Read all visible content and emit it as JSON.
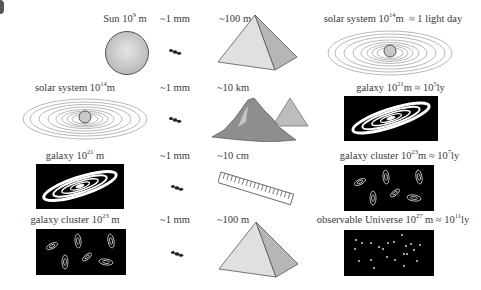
{
  "rows": [
    {
      "left": {
        "name": "Sun",
        "exp": "9",
        "unit": "m",
        "suffix": "",
        "icon": "sun-icon"
      },
      "ant": {
        "label": "~1 mm",
        "icon": "ant-icon"
      },
      "mid": {
        "label": "~100 m",
        "icon": "pyramid-icon"
      },
      "right": {
        "name": "solar system",
        "exp": "14",
        "unit": "m",
        "approx": "≈ 1 light day",
        "icon": "solar-system-icon"
      }
    },
    {
      "left": {
        "name": "solar system",
        "exp": "14",
        "unit": "m",
        "icon": "solar-system-icon"
      },
      "ant": {
        "label": "~1 mm",
        "icon": "ant-icon"
      },
      "mid": {
        "label": "~10 km",
        "icon": "mountain-icon"
      },
      "right": {
        "name": "galaxy",
        "exp": "21",
        "unit": "m",
        "approx_pre": "≈ 10",
        "approx_exp": "5",
        "approx_unit": "ly",
        "icon": "galaxy-icon"
      }
    },
    {
      "left": {
        "name": "galaxy",
        "exp": "21",
        "unit": "m",
        "icon": "galaxy-icon"
      },
      "ant": {
        "label": "~1 mm",
        "icon": "ant-icon"
      },
      "mid": {
        "label": "~10 cm",
        "icon": "ruler-icon"
      },
      "right": {
        "name": "galaxy cluster",
        "exp": "23",
        "unit": "m",
        "approx_pre": "≈ 10",
        "approx_exp": "7",
        "approx_unit": "ly",
        "icon": "galaxy-cluster-icon"
      }
    },
    {
      "left": {
        "name": "galaxy cluster",
        "exp": "23",
        "unit": "m",
        "icon": "galaxy-cluster-icon"
      },
      "ant": {
        "label": "~1 mm",
        "icon": "ant-icon"
      },
      "mid": {
        "label": "~100 m",
        "icon": "pyramid-icon"
      },
      "right": {
        "name": "observable Universe",
        "exp": "27",
        "unit": "m",
        "approx_pre": "≈ 10",
        "approx_exp": "11",
        "approx_unit": "ly",
        "icon": "observable-universe-icon"
      }
    }
  ],
  "base": "10"
}
